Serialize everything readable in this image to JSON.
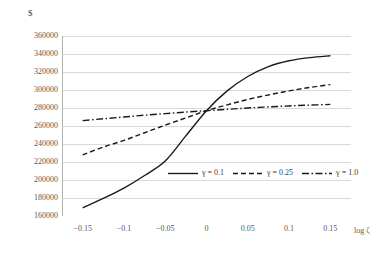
{
  "chart_data": {
    "type": "line",
    "title": "",
    "subtitle": "",
    "xlabel": "log ζ",
    "ylabel": "$",
    "xlim": [
      -0.175,
      0.175
    ],
    "ylim": [
      160000,
      360000
    ],
    "grid": true,
    "grid_axis": "y",
    "legend_position": "bottom-center-inside",
    "ytick_labels": [
      "360000",
      "340000",
      "320000",
      "300000",
      "280000",
      "260000",
      "240000",
      "220000",
      "200000",
      "180000",
      "160000"
    ],
    "ytick_values": [
      360000,
      340000,
      320000,
      300000,
      280000,
      260000,
      240000,
      220000,
      200000,
      180000,
      160000
    ],
    "xtick_labels": [
      "−0.15",
      "−0.1",
      "−0.05",
      "0",
      "0.05",
      "0.1",
      "0.15"
    ],
    "xtick_values": [
      -0.15,
      -0.1,
      -0.05,
      0,
      0.05,
      0.1,
      0.15
    ],
    "x": [
      -0.15,
      -0.125,
      -0.1,
      -0.075,
      -0.05,
      -0.025,
      0,
      0.025,
      0.05,
      0.075,
      0.1,
      0.125,
      0.15
    ],
    "series": [
      {
        "name": "γ = 0.1",
        "legend_label": "γ = 0.1",
        "style": "solid",
        "color": "#1a1a1a",
        "values": [
          169000,
          179500,
          191000,
          205000,
          221000,
          249000,
          277000,
          299000,
          315000,
          326000,
          332500,
          336000,
          338000
        ]
      },
      {
        "name": "γ = 0.25",
        "legend_label": "γ = 0.25",
        "style": "dashed",
        "color": "#1a1a1a",
        "values": [
          228000,
          236500,
          244000,
          252500,
          261000,
          269000,
          277000,
          283500,
          289500,
          294500,
          299000,
          302800,
          306000
        ]
      },
      {
        "name": "γ = 1.0",
        "legend_label": "γ = 1.0",
        "style": "dashdot",
        "color": "#1a1a1a",
        "values": [
          266000,
          268000,
          270000,
          272000,
          273800,
          275500,
          277000,
          278500,
          280000,
          281200,
          282300,
          283200,
          284000
        ]
      }
    ]
  }
}
